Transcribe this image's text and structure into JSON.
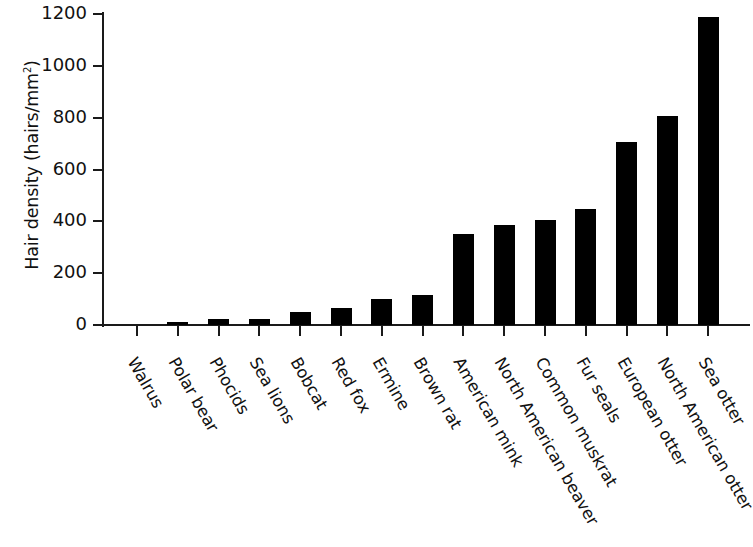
{
  "chart_data": {
    "type": "bar",
    "title": "",
    "xlabel": "",
    "ylabel": "Hair density (hairs/mm²)",
    "ylabel_base": "Hair density (hairs/mm",
    "ylabel_sup": "2",
    "ylabel_tail": ")",
    "ylim": [
      0,
      1200
    ],
    "ytick_labels": [
      "1200",
      "1000",
      "800",
      "600",
      "400",
      "200",
      "0"
    ],
    "ytick_values": [
      1200,
      1000,
      800,
      600,
      400,
      200,
      0
    ],
    "grid": false,
    "legend": false,
    "bar_color": "#000000",
    "axis_color": "#1a1a1a",
    "categories": [
      "Walrus",
      "Polar bear",
      "Phocids",
      "Sea lions",
      "Bobcat",
      "Red fox",
      "Ermine",
      "Brown rat",
      "American mink",
      "North American beaver",
      "Common muskrat",
      "Fur seals",
      "European otter",
      "North American otter",
      "Sea otter"
    ],
    "values": [
      1,
      12,
      23,
      25,
      50,
      65,
      100,
      116,
      352,
      385,
      405,
      447,
      706,
      805,
      1190
    ]
  }
}
